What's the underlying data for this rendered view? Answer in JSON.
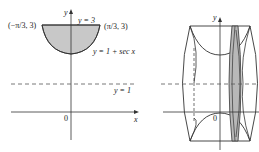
{
  "left_graph": {
    "y_axis_label": "y",
    "x_axis_label": "x",
    "origin_label": "0",
    "top_line_label": "y = 3",
    "curve_label": "y = 1 + sec x",
    "asymptote_label": "y = 1",
    "left_point_label": "(−π/3, 3)",
    "right_point_label": "(π/3, 3)",
    "fill_color": "#c8c8c8"
  },
  "right_graph": {
    "y_axis_label": "y",
    "origin_label": "0",
    "x_axis_label": "x",
    "washer_fill_color": "#b8b8b8"
  }
}
